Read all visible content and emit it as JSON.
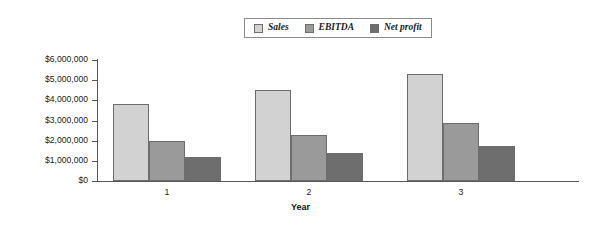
{
  "chart_data": {
    "type": "bar",
    "title": "",
    "xlabel": "Year",
    "ylabel": "",
    "categories": [
      "1",
      "2",
      "3"
    ],
    "series": [
      {
        "name": "Sales",
        "color": "#d2d2d2",
        "values": [
          3800000,
          4500000,
          5300000
        ]
      },
      {
        "name": "EBITDA",
        "color": "#9a9a9a",
        "values": [
          2000000,
          2300000,
          2900000
        ]
      },
      {
        "name": "Net profit",
        "color": "#6e6e6e",
        "values": [
          1200000,
          1400000,
          1750000
        ]
      }
    ],
    "ylim": [
      0,
      6000000
    ],
    "ytick_values": [
      0,
      1000000,
      2000000,
      3000000,
      4000000,
      5000000,
      6000000
    ],
    "ytick_labels": [
      "$0",
      "$1,000,000",
      "$2,000,000",
      "$3,000,000",
      "$4,000,000",
      "$5,000,000",
      "$6,000,000"
    ],
    "grid": false,
    "legend_position": "top-center"
  },
  "legend": {
    "items": [
      {
        "label": "Sales"
      },
      {
        "label": "EBITDA"
      },
      {
        "label": "Net profit"
      }
    ]
  },
  "axes": {
    "x_title": "Year",
    "categories": [
      "1",
      "2",
      "3"
    ],
    "y_labels": [
      "$6,000,000",
      "$5,000,000",
      "$4,000,000",
      "$3,000,000",
      "$2,000,000",
      "$1,000,000",
      "$0"
    ]
  }
}
